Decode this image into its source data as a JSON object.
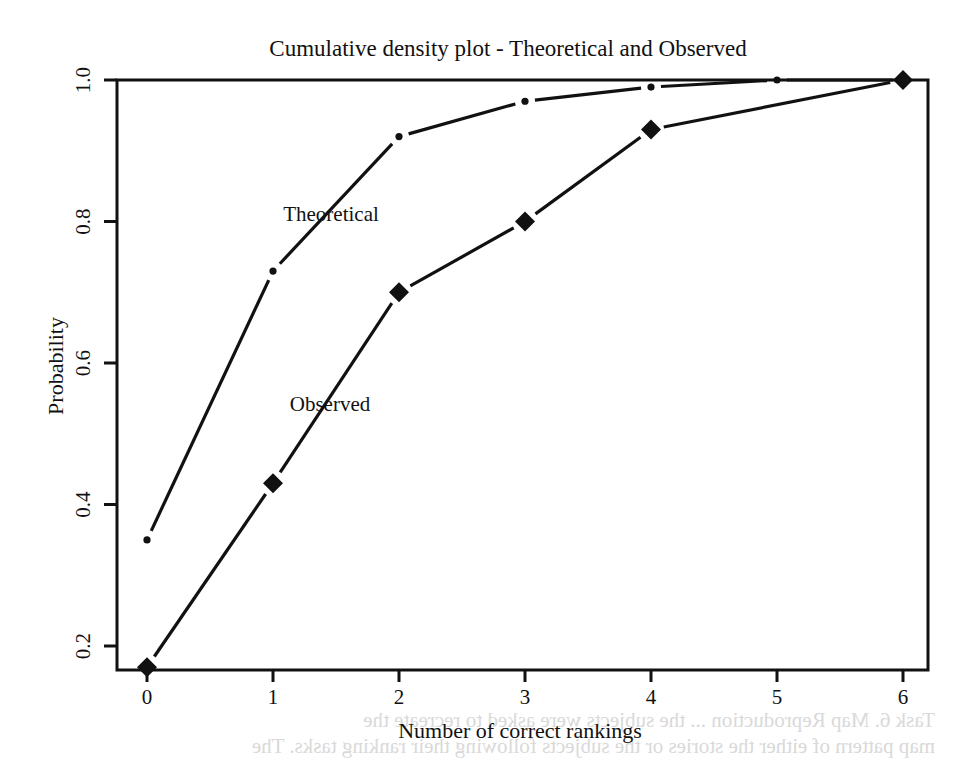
{
  "chart_data": {
    "type": "line",
    "title": "Cumulative density plot - Theoretical and Observed",
    "xlabel": "Number of correct rankings",
    "ylabel": "Probability",
    "x": [
      0,
      1,
      2,
      3,
      4,
      5,
      6
    ],
    "x_ticks": [
      "0",
      "1",
      "2",
      "3",
      "4",
      "5",
      "6"
    ],
    "y_ticks": [
      "0.2",
      "0.4",
      "0.6",
      "0.8",
      "1.0"
    ],
    "ylim": [
      0.17,
      1.0
    ],
    "xlim": [
      -0.1,
      6.2
    ],
    "grid": false,
    "legend": "inline labels",
    "series": [
      {
        "name": "Theoretical",
        "marker": "dot",
        "x": [
          0,
          1,
          2,
          3,
          4,
          5,
          6
        ],
        "values": [
          0.35,
          0.73,
          0.92,
          0.97,
          0.99,
          1.0,
          1.0
        ],
        "label_pos": {
          "x": 1.45,
          "y": 0.81
        }
      },
      {
        "name": "Observed",
        "marker": "diamond",
        "x": [
          0,
          1,
          2,
          3,
          4,
          6
        ],
        "values": [
          0.17,
          0.43,
          0.7,
          0.8,
          0.93,
          1.0
        ],
        "label_pos": {
          "x": 1.45,
          "y": 0.54
        }
      }
    ]
  },
  "background_bleed": {
    "line1": "Task 6. Map Reproduction ... the subjects were asked to recreate the",
    "line2": "map pattern of either the stories or the subjects following their ranking tasks. The"
  },
  "colors": {
    "line": "#111111",
    "frame": "#111111",
    "background": "#ffffff",
    "bleed": "#d9d9d9"
  }
}
